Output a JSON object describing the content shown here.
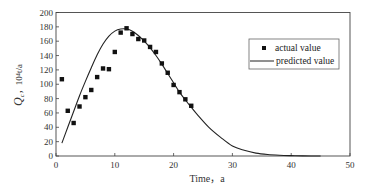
{
  "chart_data": {
    "type": "scatter",
    "title": "",
    "xlabel": "Time，a",
    "ylabel_main": "Q",
    "ylabel_sub": "c",
    "ylabel_unit": "10⁴t/a",
    "xlim": [
      0,
      50
    ],
    "ylim": [
      0,
      200
    ],
    "xticks": [
      0,
      10,
      20,
      30,
      40,
      50
    ],
    "yticks": [
      0,
      20,
      40,
      60,
      80,
      100,
      120,
      140,
      160,
      180,
      200
    ],
    "grid": false,
    "legend_position": "upper right",
    "series": [
      {
        "name": "actual value",
        "type": "scatter",
        "marker": "square",
        "x": [
          1,
          2,
          3,
          4,
          5,
          6,
          7,
          8,
          9,
          10,
          11,
          12,
          13,
          14,
          15,
          16,
          17,
          18,
          19,
          20,
          21,
          22,
          23
        ],
        "y": [
          107,
          63,
          46,
          69,
          82,
          92,
          110,
          122,
          121,
          145,
          172,
          178,
          170,
          163,
          161,
          152,
          145,
          129,
          116,
          99,
          89,
          79,
          70
        ]
      },
      {
        "name": "predicted value",
        "type": "line",
        "x": [
          1,
          2,
          3,
          4,
          5,
          6,
          7,
          8,
          9,
          10,
          11,
          12,
          13,
          14,
          15,
          16,
          17,
          18,
          19,
          20,
          21,
          22,
          23,
          24,
          26,
          28,
          30,
          32,
          34,
          36,
          38,
          40,
          42,
          45
        ],
        "y": [
          18,
          40,
          62,
          84,
          104,
          123,
          141,
          156,
          167,
          174,
          177,
          177,
          174,
          168,
          160,
          151,
          140,
          128,
          115,
          102,
          89,
          78,
          68,
          58,
          40,
          26,
          14,
          8,
          4,
          2,
          1,
          0.5,
          0.2,
          0
        ]
      }
    ]
  },
  "legend": {
    "actual_label": "actual value",
    "predicted_label": "predicted value"
  },
  "axes": {
    "x_label": "Time，a",
    "y_label_main": "Q",
    "y_label_sub": "c",
    "y_label_unit": "，10⁴t/a"
  },
  "colors": {
    "axis": "#444444",
    "marker": "#111111",
    "line": "#222222"
  }
}
